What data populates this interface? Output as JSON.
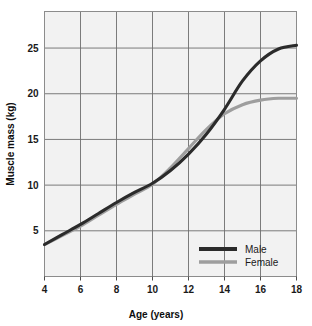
{
  "chart_data": {
    "type": "line",
    "title": "",
    "xlabel": "Age (years)",
    "ylabel": "Muscle mass (kg)",
    "xlim": [
      4,
      18
    ],
    "ylim": [
      0,
      29
    ],
    "xticks": [
      4,
      6,
      8,
      10,
      12,
      14,
      16,
      18
    ],
    "yticks": [
      5,
      10,
      15,
      20,
      25
    ],
    "xtick_labels": [
      "4",
      "6",
      "8",
      "10",
      "12",
      "14",
      "16",
      "18"
    ],
    "ytick_labels": [
      "5",
      "10",
      "15",
      "20",
      "25"
    ],
    "grid": true,
    "legend_position": "lower right",
    "x": [
      4,
      5,
      6,
      7,
      8,
      9,
      10,
      11,
      12,
      13,
      14,
      15,
      16,
      17,
      18
    ],
    "series": [
      {
        "name": "Male",
        "color": "#2b2b2b",
        "values": [
          3.5,
          4.6,
          5.7,
          6.9,
          8.1,
          9.2,
          10.2,
          11.6,
          13.4,
          15.6,
          18.3,
          21.4,
          23.6,
          24.9,
          25.3
        ]
      },
      {
        "name": "Female",
        "color": "#9e9e9e",
        "values": [
          3.5,
          4.5,
          5.5,
          6.7,
          7.9,
          9.0,
          10.1,
          11.9,
          14.0,
          16.1,
          17.8,
          18.8,
          19.3,
          19.5,
          19.5
        ]
      }
    ]
  },
  "axes": {
    "x_title": "Age (years)",
    "y_title": "Muscle mass (kg)"
  },
  "legend": {
    "entries": [
      {
        "label": "Male",
        "color": "#2b2b2b"
      },
      {
        "label": "Female",
        "color": "#9e9e9e"
      }
    ]
  },
  "colors": {
    "plot_background": "#f2f2f2",
    "grid": "#6e6e6e",
    "frame": "#8c8c8c",
    "male": "#2b2b2b",
    "female": "#9e9e9e",
    "text": "#1a1a1a"
  }
}
